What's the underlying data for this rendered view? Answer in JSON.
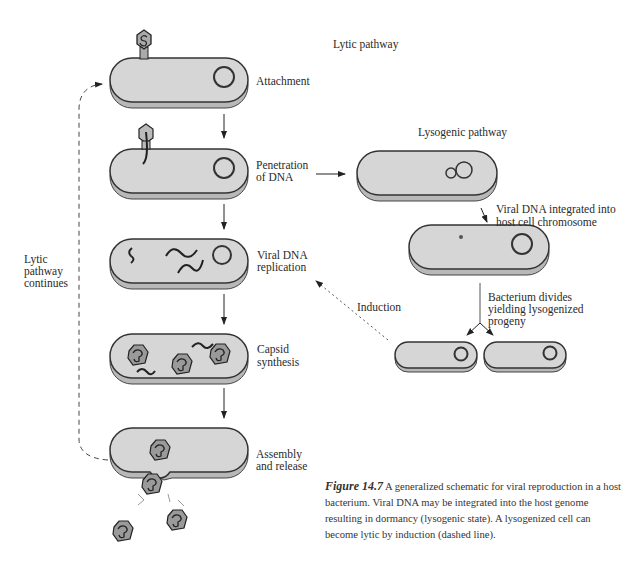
{
  "headings": {
    "lytic": "Lytic pathway",
    "lysogenic": "Lysogenic pathway"
  },
  "lytic_steps": [
    {
      "label_line1": "Attachment",
      "label_line2": ""
    },
    {
      "label_line1": "Penetration",
      "label_line2": "of DNA"
    },
    {
      "label_line1": "Viral DNA",
      "label_line2": "replication"
    },
    {
      "label_line1": "Capsid",
      "label_line2": "synthesis"
    },
    {
      "label_line1": "Assembly",
      "label_line2": "and release"
    }
  ],
  "lysogenic_steps": {
    "integrated_line1": "Viral DNA integrated into",
    "integrated_line2": "host cell chromosome",
    "divides_line1": "Bacterium divides",
    "divides_line2": "yielding lysogenized",
    "divides_line3": "progeny"
  },
  "side_labels": {
    "continues_line1": "Lytic",
    "continues_line2": "pathway",
    "continues_line3": "continues",
    "induction": "Induction"
  },
  "caption": {
    "figure_label": "Figure 14.7",
    "text": "A generalized schematic for viral reproduction in a host bacterium. Viral DNA may be integrated into the host genome resulting in dormancy (lysogenic state). A lysogenized cell can become lytic by induction (dashed line)."
  },
  "colors": {
    "cell_fill": "#d6d6d6",
    "cell_edge": "#a8a8a8",
    "outline": "#333333"
  }
}
